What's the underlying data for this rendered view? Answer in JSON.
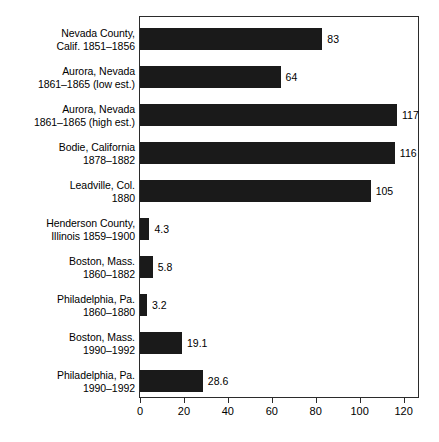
{
  "chart_data": {
    "type": "bar",
    "orientation": "horizontal",
    "title": "",
    "subtitle": "",
    "xlabel": "",
    "ylabel": "",
    "xlim": [
      0,
      127
    ],
    "xticks": [
      0,
      20,
      40,
      60,
      80,
      100,
      120
    ],
    "xticklabels": [
      "0",
      "20",
      "40",
      "60",
      "80",
      "100",
      "120"
    ],
    "grid": false,
    "legend": null,
    "bar_color": "#1a1a1a",
    "frame_color": "#2b2b2b",
    "background": "#ffffff",
    "categories": [
      "Nevada County,\nCalif. 1851–1856",
      "Aurora, Nevada\n1861–1865 (low est.)",
      "Aurora, Nevada\n1861–1865 (high est.)",
      "Bodie, California\n1878–1882",
      "Leadville, Col.\n1880",
      "Henderson County,\nIllinois 1859–1900",
      "Boston, Mass.\n1860–1882",
      "Philadelphia, Pa.\n1860–1880",
      "Boston, Mass.\n1990–1992",
      "Philadelphia, Pa.\n1990–1992"
    ],
    "values": [
      83,
      64,
      117,
      116,
      105,
      4.3,
      5.8,
      3.2,
      19.1,
      28.6
    ],
    "value_labels": [
      "83",
      "64",
      "117",
      "116",
      "105",
      "4.3",
      "5.8",
      "3.2",
      "19.1",
      "28.6"
    ]
  }
}
